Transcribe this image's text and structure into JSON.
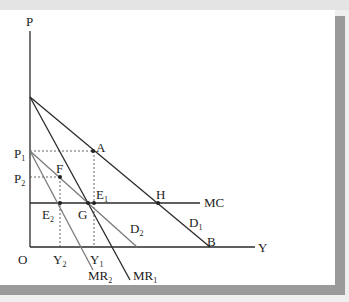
{
  "diagram": {
    "axes": {
      "y_label": "P",
      "x_label": "Y",
      "origin_label": "O"
    },
    "price_labels": {
      "p1": {
        "base": "P",
        "sub": "1"
      },
      "p2": {
        "base": "P",
        "sub": "2"
      }
    },
    "quantity_labels": {
      "y1": {
        "base": "Y",
        "sub": "1"
      },
      "y2": {
        "base": "Y",
        "sub": "2"
      }
    },
    "curves": {
      "mc": "MC",
      "d1": {
        "base": "D",
        "sub": "1"
      },
      "d2": {
        "base": "D",
        "sub": "2"
      },
      "mr1": {
        "base": "MR",
        "sub": "1"
      },
      "mr2": {
        "base": "MR",
        "sub": "2"
      }
    },
    "points": {
      "a": "A",
      "b": "B",
      "f": "F",
      "g": "G",
      "h": "H",
      "e1": {
        "base": "E",
        "sub": "1"
      },
      "e2": {
        "base": "E",
        "sub": "2"
      }
    },
    "colors": {
      "line_dark": "#2a2a2a",
      "line_gray": "#7a7a7a",
      "dashed": "#555555",
      "frame_shadow": "#9a9a9a"
    }
  }
}
